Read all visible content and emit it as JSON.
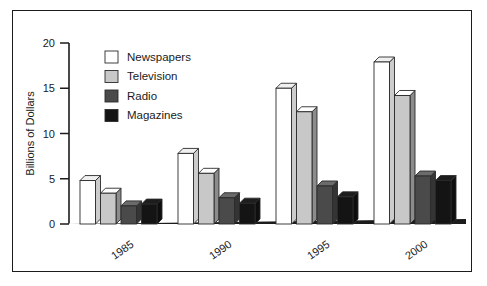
{
  "chart_data": {
    "type": "bar",
    "title": "",
    "subtitle": "",
    "xlabel": "",
    "ylabel": "Billions of Dollars",
    "categories": [
      "1985",
      "1990",
      "1995",
      "2000"
    ],
    "series": [
      {
        "name": "Newspapers",
        "color": "#ffffff",
        "values": [
          4.8,
          7.8,
          15.0,
          17.9
        ]
      },
      {
        "name": "Television",
        "color": "#c8c8c8",
        "values": [
          3.4,
          5.6,
          12.4,
          14.2
        ]
      },
      {
        "name": "Radio",
        "color": "#4a4a4a",
        "values": [
          2.0,
          2.9,
          4.2,
          5.3
        ]
      },
      {
        "name": "Magazines",
        "color": "#141414",
        "values": [
          2.2,
          2.3,
          3.0,
          4.8
        ]
      }
    ],
    "ylim": [
      0,
      20
    ],
    "yticks": [
      0,
      5,
      10,
      15,
      20
    ],
    "ytick_labels": [
      "0",
      "5",
      "10",
      "15",
      "20"
    ],
    "grid": false,
    "legend_position": "upper-left",
    "style_3d": true,
    "category_label_rotation": -35
  },
  "legend": {
    "entries": [
      {
        "label": "Newspapers",
        "swatch": "#ffffff"
      },
      {
        "label": "Television",
        "swatch": "#c8c8c8"
      },
      {
        "label": "Radio",
        "swatch": "#4a4a4a"
      },
      {
        "label": "Magazines",
        "swatch": "#141414"
      }
    ]
  },
  "colors": {
    "axis": "#1c1c1c",
    "frame": "#1c1c1c",
    "background": "#ffffff",
    "shadow": "#b7b7b7"
  }
}
